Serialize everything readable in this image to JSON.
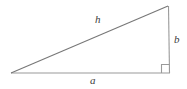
{
  "figure": {
    "name": "right-triangle",
    "background_color": "#ffffff",
    "line_color": "#8c8c8c",
    "hypotenuse_color": "#7a7a7a",
    "label_color": "#3c3c3c",
    "stroke_width": 1
  },
  "labels": {
    "hypotenuse": "h",
    "vertical_leg": "b",
    "horizontal_leg": "a"
  },
  "geometry": {
    "vertices": {
      "left": {
        "x": 11,
        "y": 73
      },
      "bottom_right": {
        "x": 170,
        "y": 73
      },
      "top_right": {
        "x": 168,
        "y": 6
      }
    },
    "right_angle_marker": {
      "at": "bottom_right",
      "size": 8
    }
  }
}
